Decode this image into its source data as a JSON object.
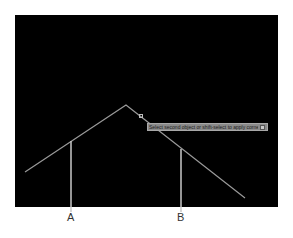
{
  "canvas": {
    "background": "#000000",
    "line_color": "#9a9a9a",
    "leader_color": "#c8c8c8"
  },
  "drawing": {
    "polyline": [
      [
        25,
        172
      ],
      [
        126,
        105
      ],
      [
        245,
        198
      ]
    ],
    "leaders": [
      {
        "id": "A",
        "x": 71,
        "y_top": 141,
        "y_bottom": 212
      },
      {
        "id": "B",
        "x": 181,
        "y_top": 149,
        "y_bottom": 212
      }
    ]
  },
  "tooltip": {
    "text": "Select second object or shift-select to apply corner or",
    "dropdown_icon": "dropdown-arrow-icon"
  },
  "cursor": {
    "icon": "pickbox-cursor-icon"
  },
  "labels": {
    "a": "A",
    "b": "B"
  }
}
